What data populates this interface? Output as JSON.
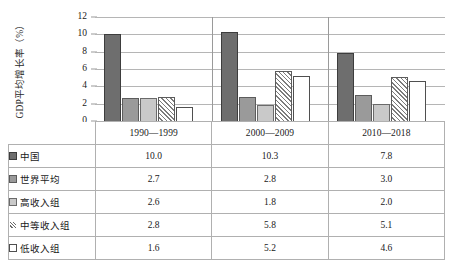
{
  "chart_data": {
    "type": "bar",
    "title": "",
    "xlabel": "",
    "ylabel": "GDP平均增长率（%）",
    "ylim": [
      0,
      12
    ],
    "yticks": [
      12,
      10,
      8,
      6,
      4,
      2,
      0
    ],
    "grid": true,
    "legend_position": "table-below",
    "categories": [
      "1990—1999",
      "2000—2009",
      "2010—2018"
    ],
    "series": [
      {
        "name": "中国",
        "values": [
          10.0,
          10.3,
          7.8
        ],
        "swatch": "dark-gray-solid",
        "color": "#6e6e6e"
      },
      {
        "name": "世界平均",
        "values": [
          2.7,
          2.8,
          3.0
        ],
        "swatch": "medium-gray-solid",
        "color": "#9a9a9a"
      },
      {
        "name": "高收入组",
        "values": [
          2.6,
          1.8,
          2.0
        ],
        "swatch": "light-gray-solid",
        "color": "#c9c9c9"
      },
      {
        "name": "中等收入组",
        "values": [
          2.8,
          5.8,
          5.1
        ],
        "swatch": "diagonal-hatch",
        "color": "#ffffff"
      },
      {
        "name": "低收入组",
        "values": [
          1.6,
          5.2,
          4.6
        ],
        "swatch": "white-outline",
        "color": "#ffffff"
      }
    ]
  },
  "axis": {
    "y_title": "GDP平均增长率（%）",
    "y_tick_labels": [
      "12",
      "10",
      "8",
      "6",
      "4",
      "2",
      "0"
    ]
  },
  "table": {
    "corner_label": "",
    "headers": [
      "1990—1999",
      "2000—2009",
      "2010—2018"
    ],
    "rows": [
      {
        "label": "中国",
        "values": [
          "10.0",
          "10.3",
          "7.8"
        ]
      },
      {
        "label": "世界平均",
        "values": [
          "2.7",
          "2.8",
          "3.0"
        ]
      },
      {
        "label": "高收入组",
        "values": [
          "2.6",
          "1.8",
          "2.0"
        ]
      },
      {
        "label": "中等收入组",
        "values": [
          "2.8",
          "5.8",
          "5.1"
        ]
      },
      {
        "label": "低收入组",
        "values": [
          "1.6",
          "5.2",
          "4.6"
        ]
      }
    ]
  }
}
